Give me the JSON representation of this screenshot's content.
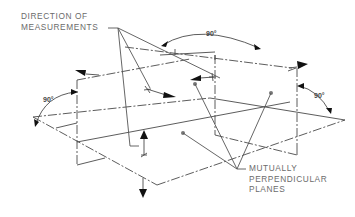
{
  "labels": {
    "direction": [
      "DIRECTION OF",
      "MEASUREMENTS"
    ],
    "planes": [
      "MUTUALLY",
      "PERPENDICULAR",
      "PLANES"
    ]
  },
  "angles": {
    "top": "90°",
    "left": "90°",
    "right": "90°"
  },
  "colors": {
    "line": "#4a4a4a",
    "label_text": "#6b6b6b",
    "arrow": "#111111",
    "background": "#ffffff"
  }
}
